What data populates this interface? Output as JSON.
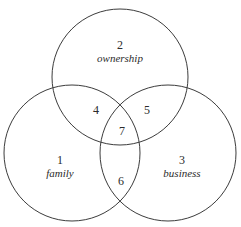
{
  "diagram": {
    "background_color": "#ffffff",
    "stroke_color": "#3c3c3c",
    "text_color": "#2b2b2b",
    "width": 241,
    "height": 227,
    "circles": [
      {
        "id": "ownership-circle",
        "cx": 120,
        "cy": 77,
        "r": 68,
        "number": "2",
        "name": "ownership",
        "label_x": 120,
        "label_y": 52
      },
      {
        "id": "family-circle",
        "cx": 72,
        "cy": 153,
        "r": 68,
        "number": "1",
        "name": "family",
        "label_x": 60,
        "label_y": 167
      },
      {
        "id": "business-circle",
        "cx": 168,
        "cy": 153,
        "r": 68,
        "number": "3",
        "name": "business",
        "label_x": 182,
        "label_y": 167
      }
    ],
    "intersections": [
      {
        "id": "family-ownership",
        "number": "4",
        "x": 96,
        "y": 110
      },
      {
        "id": "ownership-business",
        "number": "5",
        "x": 147,
        "y": 110
      },
      {
        "id": "family-business",
        "number": "6",
        "x": 121,
        "y": 181
      },
      {
        "id": "all-three",
        "number": "7",
        "x": 122,
        "y": 131
      }
    ]
  }
}
